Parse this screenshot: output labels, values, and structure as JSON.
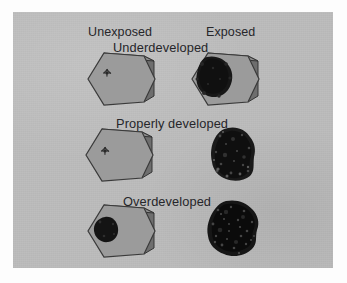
{
  "figure": {
    "title_text": "",
    "background_color": "#bcbcbc",
    "border_color": "#fdfdfd",
    "text_color": "#26262a",
    "crystal_face_color": "#9a9a9a",
    "crystal_side_color": "#6f6f6f",
    "crystal_top_color": "#8a8a8a",
    "crystal_outline_color": "#3c3c3c",
    "silver_grain_color": "#1a1a1a"
  },
  "columns": [
    {
      "id": "unexposed",
      "label": "Unexposed"
    },
    {
      "id": "exposed",
      "label": "Exposed"
    }
  ],
  "rows": [
    {
      "id": "underdeveloped",
      "label": "Underdeveloped"
    },
    {
      "id": "properly-developed",
      "label": "Properly developed"
    },
    {
      "id": "overdeveloped",
      "label": "Overdeveloped"
    }
  ],
  "cells": [
    {
      "id": "unexposed-underdeveloped",
      "row": "Underdeveloped",
      "column": "Unexposed",
      "specimen": "hexagonal silver halide crystal, clear, with tiny latent-image speck",
      "has_crystal": true,
      "deposit": "speck"
    },
    {
      "id": "exposed-underdeveloped",
      "row": "Underdeveloped",
      "column": "Exposed",
      "specimen": "hexagonal crystal partly converted to dark silver grain at upper left",
      "has_crystal": true,
      "deposit": "partial-blob"
    },
    {
      "id": "unexposed-properly-developed",
      "row": "Properly developed",
      "column": "Unexposed",
      "specimen": "hexagonal silver halide crystal, clear, with tiny speck",
      "has_crystal": true,
      "deposit": "speck"
    },
    {
      "id": "exposed-properly-developed",
      "row": "Properly developed",
      "column": "Exposed",
      "specimen": "fully developed dark filamentary silver grain",
      "has_crystal": false,
      "deposit": "full-grain"
    },
    {
      "id": "unexposed-overdeveloped",
      "row": "Overdeveloped",
      "column": "Unexposed",
      "specimen": "hexagonal crystal with round fog deposit at left",
      "has_crystal": true,
      "deposit": "fog-spot"
    },
    {
      "id": "exposed-overdeveloped",
      "row": "Overdeveloped",
      "column": "Exposed",
      "specimen": "large dense black silver grain",
      "has_crystal": false,
      "deposit": "dense-grain"
    }
  ]
}
